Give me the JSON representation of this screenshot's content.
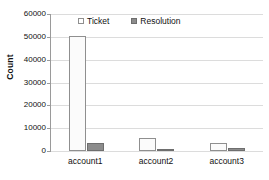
{
  "chart_data": {
    "type": "bar",
    "title": "",
    "xlabel": "",
    "ylabel": "Count",
    "categories": [
      "account1",
      "account2",
      "account3"
    ],
    "series": [
      {
        "name": "Ticket",
        "values": [
          50500,
          5700,
          3500
        ],
        "color": "#ffffff",
        "border_color": "#8f8f8f"
      },
      {
        "name": "Resolution",
        "values": [
          3700,
          1100,
          1200
        ],
        "color": "#8c8c8c",
        "border_color": "#6e6e6e"
      }
    ],
    "ylim": [
      0,
      60000
    ],
    "ytick_values": [
      0,
      10000,
      20000,
      30000,
      40000,
      50000,
      60000
    ],
    "ytick_labels": [
      "0",
      "10000",
      "20000",
      "30000",
      "40000",
      "50000",
      "60000"
    ],
    "grid": true,
    "grid_axis": "y",
    "legend_position": "top-center",
    "background": "#ffffff",
    "axis_color": "#9a9a9a",
    "grid_color": "#dcdcdc",
    "text_color": "#111111"
  }
}
